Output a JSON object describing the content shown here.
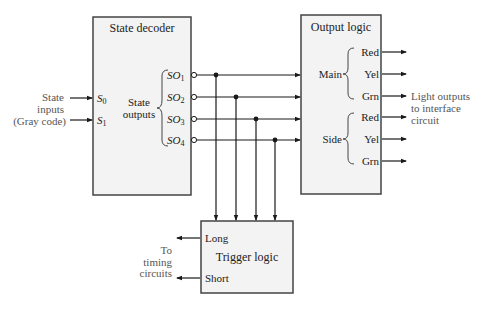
{
  "blocks": {
    "state_decoder": {
      "title": "State decoder",
      "inputs": [
        {
          "name": "S",
          "sub": "0"
        },
        {
          "name": "S",
          "sub": "1"
        }
      ],
      "outputs_group_label": [
        "State",
        "outputs"
      ],
      "outputs": [
        {
          "name": "SO",
          "sub": "1"
        },
        {
          "name": "SO",
          "sub": "2"
        },
        {
          "name": "SO",
          "sub": "3"
        },
        {
          "name": "SO",
          "sub": "4"
        }
      ]
    },
    "output_logic": {
      "title": "Output logic",
      "groups": [
        {
          "label": "Main",
          "signals": [
            "Red",
            "Yel",
            "Grn"
          ]
        },
        {
          "label": "Side",
          "signals": [
            "Red",
            "Yel",
            "Grn"
          ]
        }
      ]
    },
    "trigger_logic": {
      "title": "Trigger logic",
      "outputs": [
        "Long",
        "Short"
      ]
    }
  },
  "external_labels": {
    "state_inputs": [
      "State",
      "inputs",
      "(Gray code)"
    ],
    "light_outputs": [
      "Light outputs",
      "to interface",
      "circuit"
    ],
    "timing": [
      "To",
      "timing",
      "circuits"
    ]
  },
  "colors": {
    "line": "#1a1a1a",
    "box_fill": "#f3f3f3",
    "box_border": "#444444",
    "annotation_text": "#555555"
  }
}
